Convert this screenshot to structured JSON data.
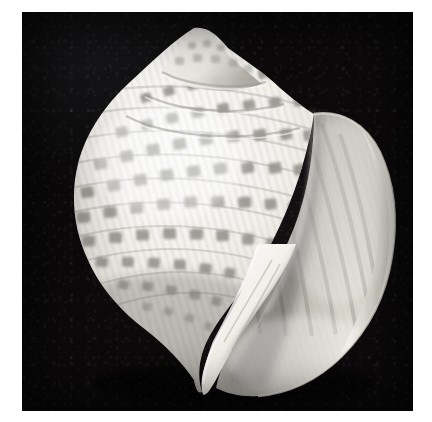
{
  "image": {
    "kind": "photograph",
    "medium": "black-and-white photographic plate",
    "subject": "seashell",
    "subject_detail": "large sea snail shell (tun / triton type gastropod), apertural view",
    "orientation": "spire up, aperture facing right",
    "background_color": "#0b0909",
    "page_background_color": "#ffffff",
    "shell_highlight_color": "#fbfaf7",
    "shell_midtone_color": "#cfcdc6",
    "shell_shadow_color": "#6e6c67",
    "spot_color": "#8e8d88",
    "aperture_interior_color": "#7d7c78",
    "alt_text": "Black and white photograph of a rounded seashell with a pointed spire, spiral rows of dark square blotches, and a large smooth aperture on the right, against a black background.",
    "plate": {
      "left": 22,
      "top": 12,
      "width": 391,
      "height": 399
    },
    "features": [
      {
        "name": "apex",
        "label": "spire apex"
      },
      {
        "name": "spire",
        "label": "stepped spire whorls"
      },
      {
        "name": "body-whorl",
        "label": "body whorl with spotted spiral cords"
      },
      {
        "name": "outer-lip",
        "label": "flaring outer lip"
      },
      {
        "name": "aperture",
        "label": "aperture interior"
      },
      {
        "name": "columella",
        "label": "columella"
      },
      {
        "name": "siphonal-canal",
        "label": "siphonal canal"
      }
    ],
    "spot_rows": [
      7,
      9,
      10,
      11,
      11,
      10,
      9,
      7,
      5
    ]
  }
}
